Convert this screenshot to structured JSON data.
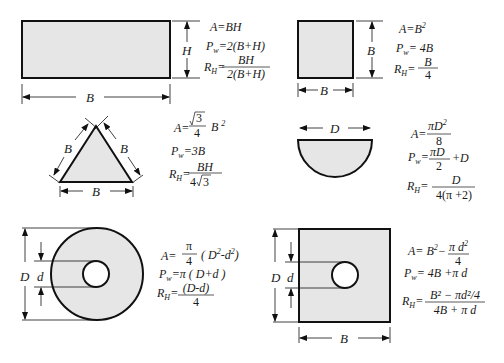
{
  "diagram": {
    "colors": {
      "fill": "#e6e6e6",
      "stroke": "#111111",
      "text": "#1a1a1a"
    },
    "shapes": [
      {
        "id": "rectangle",
        "dims": {
          "width": "B",
          "height": "H"
        },
        "formulas": {
          "area": "A=BH",
          "perimeter": "Pw=2(B+H)",
          "hydraulic_radius": "RH=BH/2(B+H)"
        }
      },
      {
        "id": "square",
        "dims": {
          "width": "B",
          "height": "B"
        },
        "formulas": {
          "area": "A=B²",
          "perimeter": "Pw=4B",
          "hydraulic_radius": "RH=B/4"
        }
      },
      {
        "id": "equilateral-triangle",
        "dims": {
          "side_left": "B",
          "side_right": "B",
          "base": "B"
        },
        "formulas": {
          "area": "A=√3/4 B²",
          "perimeter": "Pw=3B",
          "hydraulic_radius": "RH=BH/4√3"
        }
      },
      {
        "id": "semicircle",
        "dims": {
          "diameter": "D"
        },
        "formulas": {
          "area": "A=πD²/8",
          "perimeter": "Pw=πD/2+D",
          "hydraulic_radius": "RH=D/4(π+2)"
        }
      },
      {
        "id": "annulus",
        "dims": {
          "outer": "D",
          "inner": "d"
        },
        "formulas": {
          "area": "A=π/4 (D²-d²)",
          "perimeter": "Pw=π(D+d)",
          "hydraulic_radius": "RH=(D-d)/4"
        }
      },
      {
        "id": "square-with-hole",
        "dims": {
          "height": "D",
          "hole": "d",
          "width": "B"
        },
        "formulas": {
          "area": "A=B²−πd²/4",
          "perimeter": "Pw=4B+πd",
          "hydraulic_radius": "RH=(B²−πd²/4)/(4B+πd)"
        }
      }
    ],
    "labels": {
      "B": "B",
      "H": "H",
      "D": "D",
      "d": "d",
      "A": "A",
      "P": "P",
      "w": "w",
      "R": "R",
      "Hsub": "H",
      "eq": "=",
      "rect_A": "BH",
      "rect_P": "2(B+H)",
      "rect_Rnum": "BH",
      "rect_Rden": "2(B+H)",
      "sq_A": "B",
      "sq_A_exp": "2",
      "sq_P": "4B",
      "sq_Rnum": "B",
      "sq_Rden": "4",
      "tri_A_num": "3",
      "tri_A_den": "4",
      "tri_A_tail": "B",
      "tri_A_exp": "2",
      "tri_P": "3B",
      "tri_Rnum": "BH",
      "tri_Rden_a": "4",
      "tri_Rden_b": "3",
      "semi_A_num": "πD",
      "semi_A_exp": "2",
      "semi_A_den": "8",
      "semi_P_num": "πD",
      "semi_P_den": "2",
      "semi_P_tail": "+D",
      "semi_R_num": "D",
      "semi_R_den": "4(π +2)",
      "ann_A_num": "π",
      "ann_A_den": "4",
      "ann_A_tail_a": "( D",
      "ann_A_tail_exp1": "2",
      "ann_A_tail_b": "-d",
      "ann_A_tail_exp2": "2",
      "ann_A_tail_c": ")",
      "ann_P": "π ( D+d )",
      "ann_R_num": "(D-d)",
      "ann_R_den": "4",
      "sqh_A_a": "B",
      "sqh_A_exp": "2",
      "sqh_A_b": "−",
      "sqh_A_num": "π d",
      "sqh_A_num_exp": "2",
      "sqh_A_den": "4",
      "sqh_P": "4B +π d",
      "sqh_R_num": "B² − πd²/4",
      "sqh_R_den": "4B + π d"
    }
  }
}
